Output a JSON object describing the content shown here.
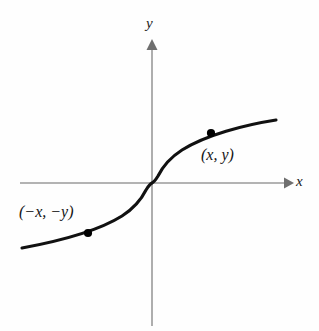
{
  "figure": {
    "background_color": "#fefefe",
    "axis_color": "#9a9a9a",
    "curve_color": "#111111",
    "point_color": "#000000",
    "text_color": "#141414",
    "axes": {
      "x_label": "x",
      "y_label": "y",
      "x_label_name": "x-axis-label",
      "y_label_name": "y-axis-label",
      "x_axis_y_px": 183,
      "y_axis_x_px": 152,
      "x_axis_start_px": 20,
      "x_axis_end_px": 288,
      "y_axis_top_px": 42,
      "y_axis_bottom_px": 326,
      "arrowheads": [
        "x-axis-arrow",
        "y-axis-arrow"
      ],
      "ticks": [],
      "tick_labels": [],
      "grid": false
    },
    "annotations": [
      {
        "text": "(x, y)",
        "name": "point-label-positive",
        "x_px": 201,
        "y_px": 147
      },
      {
        "text": "(−x, −y)",
        "name": "point-label-negative",
        "x_px": 19,
        "y_px": 204
      }
    ]
  },
  "chart_data": {
    "type": "line",
    "title": "",
    "subtitle": "",
    "xlabel": "x",
    "ylabel": "y",
    "xlim": [
      -4,
      4
    ],
    "ylim": [
      -4,
      4
    ],
    "grid": false,
    "legend": null,
    "legend_position": "none",
    "series": [
      {
        "name": "odd function y = f(x)",
        "type": "line",
        "x": [
          -3.9,
          -3.5,
          -3.0,
          -2.5,
          -2.0,
          -1.5,
          -1.0,
          -0.6,
          -0.3,
          -0.12,
          -0.04,
          0.0,
          0.04,
          0.12,
          0.3,
          0.6,
          1.0,
          1.5,
          2.0,
          2.5,
          3.0,
          3.5,
          3.9
        ],
        "y": [
          -1.57,
          -1.52,
          -1.44,
          -1.36,
          -1.26,
          -1.14,
          -1.0,
          -0.84,
          -0.67,
          -0.49,
          -0.34,
          0.0,
          0.34,
          0.49,
          0.67,
          0.84,
          1.0,
          1.14,
          1.26,
          1.36,
          1.44,
          1.52,
          1.57
        ]
      }
    ],
    "points": [
      {
        "label": "(x, y)",
        "x": 1.95,
        "y": 1.25,
        "px": 211,
        "py": 133
      },
      {
        "label": "(−x, −y)",
        "x": -1.95,
        "y": -1.25,
        "px": 88,
        "py": 233
      }
    ],
    "annotations": [
      {
        "text": "(x, y)",
        "attached_to_point_index": 0
      },
      {
        "text": "(−x, −y)",
        "attached_to_point_index": 1
      }
    ]
  }
}
